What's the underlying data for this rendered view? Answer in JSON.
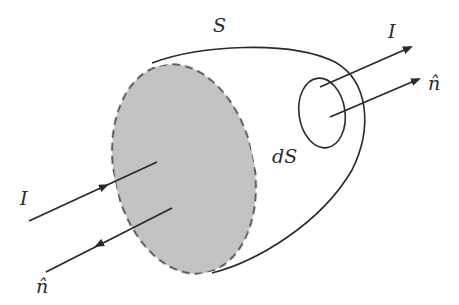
{
  "diagram": {
    "labels": {
      "surface": "S",
      "current_out": "I",
      "normal_out": "n̂",
      "area_element": "dS",
      "current_in": "I",
      "normal_in": "n̂"
    },
    "colors": {
      "stroke": "#2a2a2a",
      "shaded_face": "#c4c4c4",
      "background": "#ffffff"
    }
  }
}
